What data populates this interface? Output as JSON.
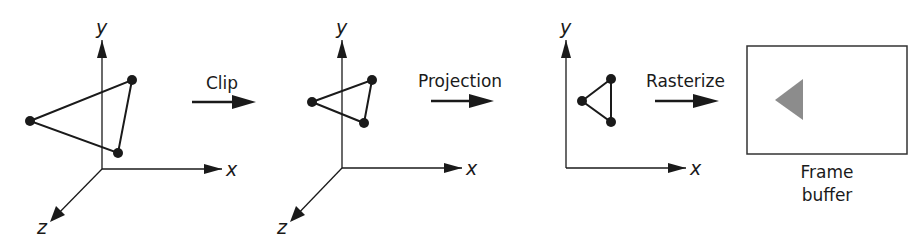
{
  "diagram": {
    "steps": [
      {
        "label": "Clip"
      },
      {
        "label": "Projection"
      },
      {
        "label": "Rasterize"
      }
    ],
    "panels": [
      {
        "name": "3d-scene-input",
        "axes": {
          "x": "x",
          "y": "y",
          "z": "z"
        }
      },
      {
        "name": "3d-scene-clipped",
        "axes": {
          "x": "x",
          "y": "y",
          "z": "z"
        }
      },
      {
        "name": "2d-projected",
        "axes": {
          "x": "x",
          "y": "y"
        }
      }
    ],
    "frame_buffer": {
      "label_line1": "Frame",
      "label_line2": "buffer"
    },
    "colors": {
      "line": "#1a1a1a",
      "raster_triangle": "#8c8c8c",
      "background": "#ffffff"
    }
  }
}
